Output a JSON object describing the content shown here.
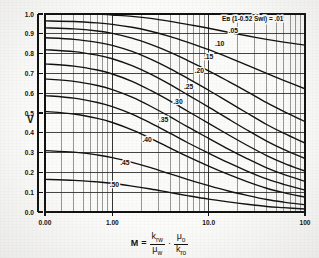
{
  "chart_data": {
    "type": "line",
    "title": "",
    "annotation": "Eʙ (1-0.52 Swi) = .01",
    "xlabel_text": "M =",
    "xlabel_parts": {
      "m": "M",
      "equals": "=",
      "num1": "k",
      "num1_sub": "rw",
      "den1": "μ",
      "den1_sub": "w",
      "dot": "·",
      "num2": "μ",
      "num2_sub": "o",
      "den2": "k",
      "den2_sub": "ro"
    },
    "ylabel": "V",
    "xscale": "log",
    "xlim": [
      0.2,
      100
    ],
    "ylim": [
      0.0,
      1.0
    ],
    "grid": true,
    "legend_position": "inline-labels",
    "xticks": [
      {
        "value": 0.2,
        "label": "0.00"
      },
      {
        "value": 1.0,
        "label": "1.00"
      },
      {
        "value": 10.0,
        "label": "10.0"
      },
      {
        "value": 100.0,
        "label": "100"
      }
    ],
    "yticks": [
      {
        "value": 0.0,
        "label": "0.0"
      },
      {
        "value": 0.1,
        "label": "0.1"
      },
      {
        "value": 0.2,
        "label": "0.2"
      },
      {
        "value": 0.3,
        "label": "0.3"
      },
      {
        "value": 0.4,
        "label": "0.4"
      },
      {
        "value": 0.5,
        "label": "0.5"
      },
      {
        "value": 0.6,
        "label": "0.6"
      },
      {
        "value": 0.7,
        "label": "0.7"
      },
      {
        "value": 0.8,
        "label": "0.8"
      },
      {
        "value": 0.9,
        "label": "0.9"
      },
      {
        "value": 1.0,
        "label": "1.0"
      }
    ],
    "series": [
      {
        "name": ".01",
        "label": ".01",
        "label_x": 30.0,
        "label_y": 0.975,
        "points": [
          [
            0.2,
            1.0
          ],
          [
            0.4,
            1.0
          ],
          [
            0.7,
            1.0
          ],
          [
            1.0,
            0.995
          ],
          [
            1.6,
            0.988
          ],
          [
            2.5,
            0.978
          ],
          [
            4.0,
            0.963
          ],
          [
            6.0,
            0.948
          ],
          [
            10.0,
            0.928
          ],
          [
            16.0,
            0.908
          ],
          [
            25.0,
            0.89
          ],
          [
            40.0,
            0.872
          ],
          [
            60.0,
            0.858
          ],
          [
            100.0,
            0.843
          ]
        ]
      },
      {
        "name": ".05",
        "label": ".05",
        "label_x": 18.0,
        "label_y": 0.905,
        "points": [
          [
            0.2,
            0.965
          ],
          [
            0.4,
            0.962
          ],
          [
            0.7,
            0.955
          ],
          [
            1.0,
            0.948
          ],
          [
            1.6,
            0.933
          ],
          [
            2.5,
            0.913
          ],
          [
            4.0,
            0.886
          ],
          [
            6.0,
            0.858
          ],
          [
            10.0,
            0.82
          ],
          [
            16.0,
            0.781
          ],
          [
            25.0,
            0.742
          ],
          [
            40.0,
            0.7
          ],
          [
            60.0,
            0.665
          ],
          [
            100.0,
            0.622
          ]
        ]
      },
      {
        "name": ".10",
        "label": ".10",
        "label_x": 13.0,
        "label_y": 0.84,
        "points": [
          [
            0.2,
            0.93
          ],
          [
            0.4,
            0.925
          ],
          [
            0.7,
            0.914
          ],
          [
            1.0,
            0.902
          ],
          [
            1.6,
            0.878
          ],
          [
            2.5,
            0.846
          ],
          [
            4.0,
            0.806
          ],
          [
            6.0,
            0.766
          ],
          [
            10.0,
            0.713
          ],
          [
            16.0,
            0.66
          ],
          [
            25.0,
            0.608
          ],
          [
            40.0,
            0.552
          ],
          [
            60.0,
            0.508
          ],
          [
            100.0,
            0.456
          ]
        ]
      },
      {
        "name": ".15",
        "label": ".15",
        "label_x": 10.0,
        "label_y": 0.775,
        "points": [
          [
            0.2,
            0.88
          ],
          [
            0.4,
            0.872
          ],
          [
            0.7,
            0.857
          ],
          [
            1.0,
            0.842
          ],
          [
            1.6,
            0.811
          ],
          [
            2.5,
            0.772
          ],
          [
            4.0,
            0.723
          ],
          [
            6.0,
            0.676
          ],
          [
            10.0,
            0.615
          ],
          [
            16.0,
            0.556
          ],
          [
            25.0,
            0.5
          ],
          [
            40.0,
            0.442
          ],
          [
            60.0,
            0.398
          ],
          [
            100.0,
            0.348
          ]
        ]
      },
      {
        "name": ".20",
        "label": ".20",
        "label_x": 8.0,
        "label_y": 0.7,
        "points": [
          [
            0.2,
            0.82
          ],
          [
            0.4,
            0.81
          ],
          [
            0.7,
            0.792
          ],
          [
            1.0,
            0.774
          ],
          [
            1.6,
            0.739
          ],
          [
            2.5,
            0.696
          ],
          [
            4.0,
            0.643
          ],
          [
            6.0,
            0.593
          ],
          [
            10.0,
            0.53
          ],
          [
            16.0,
            0.47
          ],
          [
            25.0,
            0.414
          ],
          [
            40.0,
            0.358
          ],
          [
            60.0,
            0.316
          ],
          [
            100.0,
            0.27
          ]
        ]
      },
      {
        "name": ".25",
        "label": ".25",
        "label_x": 6.2,
        "label_y": 0.62,
        "points": [
          [
            0.2,
            0.748
          ],
          [
            0.4,
            0.737
          ],
          [
            0.7,
            0.717
          ],
          [
            1.0,
            0.697
          ],
          [
            1.6,
            0.66
          ],
          [
            2.5,
            0.614
          ],
          [
            4.0,
            0.56
          ],
          [
            6.0,
            0.51
          ],
          [
            10.0,
            0.448
          ],
          [
            16.0,
            0.39
          ],
          [
            25.0,
            0.337
          ],
          [
            40.0,
            0.285
          ],
          [
            60.0,
            0.247
          ],
          [
            100.0,
            0.206
          ]
        ]
      },
      {
        "name": ".30",
        "label": ".30",
        "label_x": 4.8,
        "label_y": 0.545,
        "points": [
          [
            0.2,
            0.672
          ],
          [
            0.4,
            0.66
          ],
          [
            0.7,
            0.639
          ],
          [
            1.0,
            0.618
          ],
          [
            1.6,
            0.58
          ],
          [
            2.5,
            0.534
          ],
          [
            4.0,
            0.48
          ],
          [
            6.0,
            0.431
          ],
          [
            10.0,
            0.372
          ],
          [
            16.0,
            0.318
          ],
          [
            25.0,
            0.27
          ],
          [
            40.0,
            0.223
          ],
          [
            60.0,
            0.19
          ],
          [
            100.0,
            0.155
          ]
        ]
      },
      {
        "name": ".35",
        "label": ".35",
        "label_x": 3.4,
        "label_y": 0.455,
        "points": [
          [
            0.2,
            0.588
          ],
          [
            0.4,
            0.575
          ],
          [
            0.7,
            0.553
          ],
          [
            1.0,
            0.532
          ],
          [
            1.6,
            0.494
          ],
          [
            2.5,
            0.449
          ],
          [
            4.0,
            0.397
          ],
          [
            6.0,
            0.351
          ],
          [
            10.0,
            0.297
          ],
          [
            16.0,
            0.249
          ],
          [
            25.0,
            0.207
          ],
          [
            40.0,
            0.167
          ],
          [
            60.0,
            0.14
          ],
          [
            100.0,
            0.111
          ]
        ]
      },
      {
        "name": ".40",
        "label": ".40",
        "label_x": 2.3,
        "label_y": 0.355,
        "points": [
          [
            0.2,
            0.508
          ],
          [
            0.4,
            0.495
          ],
          [
            0.7,
            0.473
          ],
          [
            1.0,
            0.452
          ],
          [
            1.6,
            0.415
          ],
          [
            2.5,
            0.372
          ],
          [
            4.0,
            0.323
          ],
          [
            6.0,
            0.281
          ],
          [
            10.0,
            0.232
          ],
          [
            16.0,
            0.19
          ],
          [
            25.0,
            0.154
          ],
          [
            40.0,
            0.12
          ],
          [
            60.0,
            0.098
          ],
          [
            100.0,
            0.075
          ]
        ]
      },
      {
        "name": ".45",
        "label": ".45",
        "label_x": 1.35,
        "label_y": 0.235,
        "points": [
          [
            0.2,
            0.31
          ],
          [
            0.4,
            0.302
          ],
          [
            0.7,
            0.288
          ],
          [
            1.0,
            0.275
          ],
          [
            1.6,
            0.251
          ],
          [
            2.5,
            0.224
          ],
          [
            4.0,
            0.192
          ],
          [
            6.0,
            0.165
          ],
          [
            10.0,
            0.133
          ],
          [
            16.0,
            0.106
          ],
          [
            25.0,
            0.084
          ],
          [
            40.0,
            0.063
          ],
          [
            60.0,
            0.05
          ],
          [
            100.0,
            0.037
          ]
        ]
      },
      {
        "name": ".50",
        "label": ".50",
        "label_x": 1.05,
        "label_y": 0.125,
        "points": [
          [
            0.2,
            0.165
          ],
          [
            0.4,
            0.16
          ],
          [
            0.7,
            0.152
          ],
          [
            1.0,
            0.145
          ],
          [
            1.6,
            0.131
          ],
          [
            2.5,
            0.116
          ],
          [
            4.0,
            0.098
          ],
          [
            6.0,
            0.083
          ],
          [
            10.0,
            0.065
          ],
          [
            16.0,
            0.051
          ],
          [
            25.0,
            0.039
          ],
          [
            40.0,
            0.028
          ],
          [
            60.0,
            0.022
          ],
          [
            100.0,
            0.015
          ]
        ]
      }
    ]
  },
  "style": {
    "ink": "#121212",
    "grid": "#2b2b2b",
    "paper": "#fbfbfa"
  }
}
